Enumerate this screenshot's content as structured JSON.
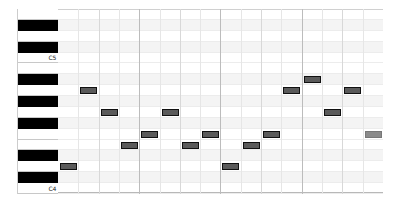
{
  "piano_roll": {
    "range": {
      "low": "C4",
      "high": "E5"
    },
    "key_labels": {
      "C5": "C5",
      "C4": "C4"
    },
    "rows": [
      "E5",
      "D#5",
      "D5",
      "C#5",
      "C5",
      "B4",
      "A#4",
      "A4",
      "G#4",
      "G4",
      "F#4",
      "F4",
      "E4",
      "D#4",
      "D4",
      "C#4",
      "C4"
    ],
    "notes": [
      {
        "step": 0,
        "pitch": "D4"
      },
      {
        "step": 1,
        "pitch": "A4"
      },
      {
        "step": 2,
        "pitch": "G4"
      },
      {
        "step": 3,
        "pitch": "E4"
      },
      {
        "step": 4,
        "pitch": "F4"
      },
      {
        "step": 5,
        "pitch": "G4"
      },
      {
        "step": 6,
        "pitch": "E4"
      },
      {
        "step": 7,
        "pitch": "F4"
      },
      {
        "step": 8,
        "pitch": "D4"
      },
      {
        "step": 9,
        "pitch": "E4"
      },
      {
        "step": 10,
        "pitch": "F4"
      },
      {
        "step": 11,
        "pitch": "A4"
      },
      {
        "step": 12,
        "pitch": "A#4"
      },
      {
        "step": 13,
        "pitch": "G4"
      },
      {
        "step": 14,
        "pitch": "A4"
      },
      {
        "step": 15,
        "pitch": "F4",
        "selected": true
      }
    ],
    "colors": {
      "note_fill": "#5a5a5a",
      "note_border": "#111111",
      "selected_fill": "#8a8a8a"
    }
  }
}
